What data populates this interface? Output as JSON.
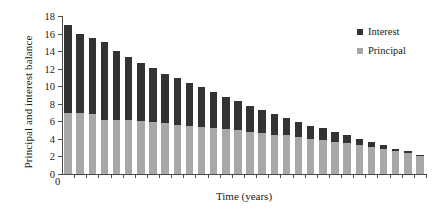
{
  "chart_data": {
    "type": "bar",
    "subtype": "stacked-bar",
    "title": "",
    "xlabel": "Time (years)",
    "ylabel": "Principal and interest balance",
    "ylim": [
      0,
      18
    ],
    "ytick_labels": [
      "0",
      "2",
      "4",
      "6",
      "8",
      "10",
      "12",
      "14",
      "16",
      "18"
    ],
    "ytick_values": [
      0,
      2,
      4,
      6,
      8,
      10,
      12,
      14,
      16,
      18
    ],
    "grid": false,
    "legend_position": "top-right",
    "categories": [
      1,
      2,
      3,
      4,
      5,
      6,
      7,
      8,
      9,
      10,
      11,
      12,
      13,
      14,
      15,
      16,
      17,
      18,
      19,
      20,
      21,
      22,
      23,
      24,
      25,
      26,
      27,
      28,
      29,
      30
    ],
    "series": [
      {
        "name": "Principal",
        "color": "#a8a8a8",
        "values": [
          7.0,
          6.9,
          6.8,
          6.2,
          6.2,
          6.1,
          6.0,
          5.9,
          5.8,
          5.6,
          5.5,
          5.4,
          5.2,
          5.1,
          5.0,
          4.8,
          4.7,
          4.5,
          4.4,
          4.2,
          4.0,
          3.9,
          3.7,
          3.5,
          3.3,
          3.1,
          2.9,
          2.6,
          2.4,
          2.1
        ]
      },
      {
        "name": "Interest",
        "color": "#333333",
        "values": [
          10.0,
          9.1,
          8.7,
          8.8,
          7.8,
          7.2,
          6.6,
          6.2,
          5.6,
          5.3,
          4.9,
          4.5,
          4.1,
          3.7,
          3.3,
          3.0,
          2.6,
          2.3,
          2.0,
          1.7,
          1.5,
          1.3,
          1.1,
          0.9,
          0.7,
          0.6,
          0.4,
          0.3,
          0.2,
          0.1
        ]
      }
    ],
    "totals": [
      17.0,
      16.0,
      15.5,
      15.0,
      14.0,
      13.3,
      12.6,
      12.1,
      11.4,
      10.9,
      10.4,
      9.9,
      9.3,
      8.8,
      8.3,
      7.8,
      7.3,
      6.8,
      6.4,
      5.9,
      5.5,
      5.2,
      4.8,
      4.4,
      4.0,
      3.7,
      3.3,
      2.9,
      2.6,
      2.2
    ]
  },
  "legend": {
    "items": [
      {
        "label": "Interest",
        "color": "#333333"
      },
      {
        "label": "Principal",
        "color": "#a8a8a8"
      }
    ]
  },
  "axes": {
    "x_origin_label": "0"
  }
}
